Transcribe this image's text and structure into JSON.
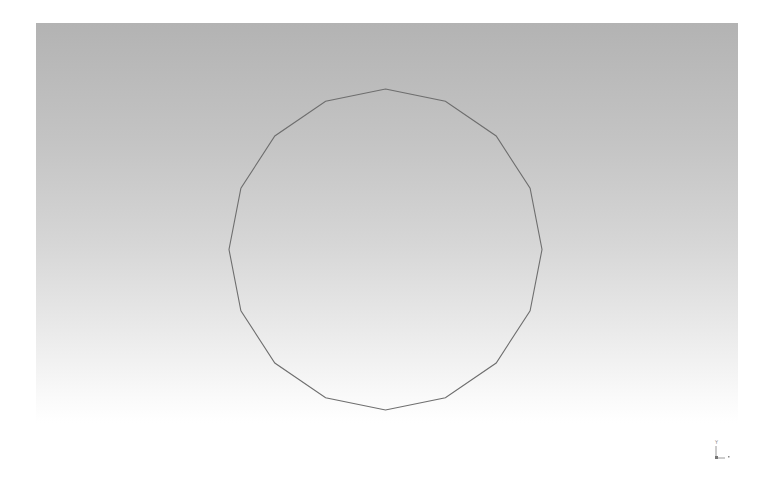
{
  "viewport": {
    "background_top": "#b3b3b3",
    "background_bottom": "#ffffff"
  },
  "shape": {
    "type": "polygon",
    "sides": 16,
    "center": [
      385.5,
      249.5
    ],
    "radius_x": 156.5,
    "radius_y": 160.5,
    "stroke_color": "#6e6e6e"
  },
  "axis_triad": {
    "y_label": "Y",
    "x_label": "X"
  }
}
